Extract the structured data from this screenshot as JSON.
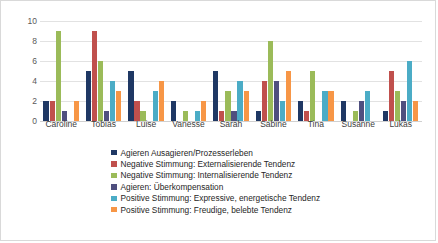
{
  "chart_data": {
    "type": "bar",
    "title": "",
    "subtitle": "",
    "xlabel": "",
    "ylabel": "",
    "ylim": [
      0,
      10
    ],
    "yticks": [
      0,
      2,
      4,
      6,
      8,
      10
    ],
    "grid": true,
    "legend_position": "bottom",
    "categories": [
      "Caroline",
      "Tobias",
      "Luise",
      "Vanesse",
      "Sarah",
      "Sabine",
      "Tina",
      "Susanne",
      "Lukas"
    ],
    "series": [
      {
        "name": "Agieren Ausagieren/Prozesserleben",
        "color": "#1F3864",
        "values": [
          2,
          5,
          5,
          2,
          5,
          1,
          2,
          2,
          1
        ]
      },
      {
        "name": "Negative Stimmung: Externalisierende Tendenz",
        "color": "#C0504D",
        "values": [
          2,
          9,
          2,
          0,
          1,
          4,
          1,
          0,
          5
        ]
      },
      {
        "name": "Negative Stimmung: Internalisierende Tendenz",
        "color": "#9BBB59",
        "values": [
          9,
          6,
          1,
          1,
          3,
          8,
          5,
          1,
          3
        ]
      },
      {
        "name": "Agieren: Überkompensation",
        "color": "#4F4F7F",
        "values": [
          1,
          1,
          0,
          0,
          1,
          4,
          0,
          2,
          2
        ]
      },
      {
        "name": "Positive Stimmung: Expressive, energetische Tendenz",
        "color": "#4BACC6",
        "values": [
          0,
          4,
          3,
          1,
          4,
          2,
          3,
          3,
          6
        ]
      },
      {
        "name": "Positive Stimmung: Freudige, belebte Tendenz",
        "color": "#F79646",
        "values": [
          2,
          3,
          4,
          2,
          3,
          5,
          3,
          0,
          2
        ]
      }
    ]
  }
}
